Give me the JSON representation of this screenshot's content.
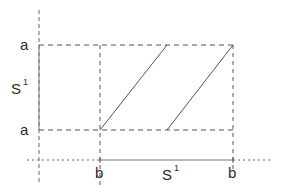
{
  "diagram": {
    "type": "torus-fundamental-domain-flow",
    "colors": {
      "line": "#555555",
      "text": "#2a2a2a",
      "background": "#ffffff"
    },
    "vertical_axis": {
      "label": "S",
      "superscript": "1",
      "top_label": "a",
      "bottom_label": "a"
    },
    "horizontal_axis": {
      "label": "S",
      "superscript": "1",
      "left_label": "b",
      "right_label": "b"
    },
    "elements": [
      {
        "name": "square-domain",
        "description": "dashed square with corners labeled a/a and b/b"
      },
      {
        "name": "flow-line-1",
        "from": "bottom-left corner (b, a)",
        "to": "top edge midpoint"
      },
      {
        "name": "flow-line-2",
        "from": "bottom edge midpoint",
        "to": "top-right corner (b, a)"
      }
    ]
  }
}
